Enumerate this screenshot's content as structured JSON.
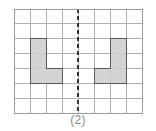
{
  "figure": {
    "caption": "(2)",
    "title": ""
  },
  "grid": {
    "columns": 8,
    "rows": 7,
    "origin_x": 14,
    "origin_y": 9,
    "cell_width": 16.1,
    "cell_height": 14.9,
    "line_color": "#b0b0b0",
    "border_color": "#9a9a9a",
    "line_width": 1,
    "background": "#ffffff"
  },
  "symmetry_line": {
    "type": "vertical-dashed",
    "at_column": 4,
    "x": 78.4,
    "y_top": 9,
    "y_bottom": 113,
    "color": "#333333",
    "width": 2,
    "dash": "4 3"
  },
  "shapes": [
    {
      "name": "left-l-shape",
      "fill": "#d4d4d4",
      "stroke": "#5a5a5a",
      "stroke_width": 1,
      "cells": [
        {
          "col": 1,
          "row": 2
        },
        {
          "col": 1,
          "row": 3
        },
        {
          "col": 1,
          "row": 4
        },
        {
          "col": 2,
          "row": 4
        }
      ]
    },
    {
      "name": "right-l-shape",
      "fill": "#d4d4d4",
      "stroke": "#5a5a5a",
      "stroke_width": 1,
      "cells": [
        {
          "col": 6,
          "row": 2
        },
        {
          "col": 6,
          "row": 3
        },
        {
          "col": 6,
          "row": 4
        },
        {
          "col": 5,
          "row": 4
        }
      ]
    }
  ],
  "chart_data": {
    "type": "diagram",
    "title": "(2)",
    "xlabel": "",
    "ylabel": "",
    "grid_columns": 8,
    "grid_rows": 7,
    "axis_of_symmetry_column": 4,
    "shape_cells_left": [
      [
        1,
        2
      ],
      [
        1,
        3
      ],
      [
        1,
        4
      ],
      [
        2,
        4
      ]
    ],
    "shape_cells_right": [
      [
        6,
        2
      ],
      [
        6,
        3
      ],
      [
        6,
        4
      ],
      [
        5,
        4
      ]
    ]
  }
}
